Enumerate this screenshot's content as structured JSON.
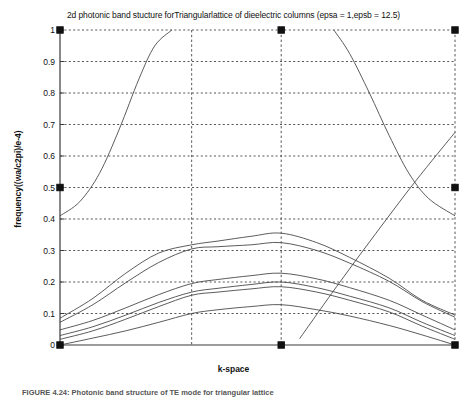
{
  "figure": {
    "title": "2d photonic band stucture forTriangularlattice of dieelectric columns (epsa = 1,epsb = 12.5)",
    "caption": "FIGURE 4.24: Photonic band structure of TE mode for triangular lattice",
    "background": "#ffffff",
    "line_color": "#4a4a4a",
    "axis_color": "#3a3a3a",
    "grid_color": "#555555"
  },
  "chart_data": {
    "type": "line",
    "title": "2d photonic band stucture forTriangularlattice of dieelectric columns (epsa = 1,epsb = 12.5)",
    "xlabel": "k-space",
    "ylabel": "frequency((wa/c2pi)/e-4)",
    "grid": true,
    "legend": "none",
    "xlim": [
      0,
      3
    ],
    "ylim": [
      0,
      1
    ],
    "yticks": [
      0,
      0.1,
      0.2,
      0.3,
      0.4,
      0.5,
      0.6,
      0.7,
      0.8,
      0.9,
      1
    ],
    "ytick_labels": [
      "0",
      "0.1",
      "0.2",
      "0.3",
      "0.4",
      "0.5",
      "0.6",
      "0.7",
      "0.8",
      "0.9",
      "1"
    ],
    "xticks": [
      0,
      1,
      1.68,
      3
    ],
    "xtick_labels": [
      "t",
      "m",
      "k",
      "t"
    ],
    "x_symmetry_points": [
      "t",
      "m",
      "k",
      "t"
    ],
    "marker_points": [
      {
        "x": 0,
        "y": 1
      },
      {
        "x": 1.68,
        "y": 1
      },
      {
        "x": 3,
        "y": 1
      },
      {
        "x": 0,
        "y": 0.5
      },
      {
        "x": 3,
        "y": 0.5
      },
      {
        "x": 0,
        "y": 0
      },
      {
        "x": 1.68,
        "y": 0
      },
      {
        "x": 3,
        "y": 0
      }
    ],
    "series": [
      {
        "name": "band-1",
        "x": [
          0,
          0.25,
          0.5,
          0.75,
          1.0,
          1.2,
          1.45,
          1.68,
          1.95,
          2.2,
          2.5,
          2.75,
          3.0
        ],
        "values": [
          0.0,
          0.022,
          0.045,
          0.072,
          0.1,
          0.112,
          0.122,
          0.128,
          0.112,
          0.092,
          0.062,
          0.032,
          0.0
        ]
      },
      {
        "name": "band-2",
        "x": [
          0,
          0.25,
          0.5,
          0.75,
          1.0,
          1.2,
          1.45,
          1.68,
          1.95,
          2.2,
          2.5,
          2.75,
          3.0
        ],
        "values": [
          0.018,
          0.045,
          0.082,
          0.122,
          0.158,
          0.168,
          0.178,
          0.185,
          0.168,
          0.142,
          0.105,
          0.06,
          0.018
        ]
      },
      {
        "name": "band-3",
        "x": [
          0,
          0.25,
          0.5,
          0.75,
          1.0,
          1.2,
          1.45,
          1.68,
          1.95,
          2.2,
          2.5,
          2.75,
          3.0
        ],
        "values": [
          0.03,
          0.058,
          0.095,
          0.135,
          0.168,
          0.18,
          0.192,
          0.2,
          0.182,
          0.155,
          0.118,
          0.072,
          0.03
        ]
      },
      {
        "name": "band-4",
        "x": [
          0,
          0.25,
          0.5,
          0.75,
          1.0,
          1.2,
          1.45,
          1.68,
          1.95,
          2.2,
          2.5,
          2.75,
          3.0
        ],
        "values": [
          0.048,
          0.078,
          0.118,
          0.16,
          0.195,
          0.208,
          0.22,
          0.228,
          0.21,
          0.182,
          0.142,
          0.095,
          0.048
        ]
      },
      {
        "name": "band-5",
        "x": [
          0,
          0.25,
          0.5,
          0.75,
          1.0,
          1.2,
          1.45,
          1.68,
          1.95,
          2.2,
          2.5,
          2.75,
          3.0
        ],
        "values": [
          0.072,
          0.128,
          0.198,
          0.262,
          0.305,
          0.312,
          0.318,
          0.325,
          0.3,
          0.26,
          0.202,
          0.138,
          0.088
        ]
      },
      {
        "name": "band-6",
        "x": [
          0,
          0.25,
          0.5,
          0.75,
          1.0,
          1.2,
          1.45,
          1.68,
          1.95,
          2.2,
          2.5,
          2.75,
          3.0
        ],
        "values": [
          0.085,
          0.148,
          0.228,
          0.292,
          0.318,
          0.33,
          0.345,
          0.355,
          0.325,
          0.278,
          0.212,
          0.142,
          0.095
        ]
      },
      {
        "name": "band-7-steep",
        "x": [
          0,
          0.15,
          0.3,
          0.45,
          0.6,
          0.72,
          0.85
        ],
        "values": [
          0.41,
          0.455,
          0.545,
          0.685,
          0.845,
          0.95,
          1.0
        ]
      },
      {
        "name": "band-8-descending",
        "x": [
          2.08,
          2.2,
          2.35,
          2.5,
          2.65,
          2.8,
          3.0
        ],
        "values": [
          1.0,
          0.925,
          0.8,
          0.665,
          0.545,
          0.465,
          0.41
        ]
      },
      {
        "name": "band-9-diagonal",
        "x": [
          1.82,
          2.1,
          2.4,
          2.7,
          3.0
        ],
        "values": [
          0.02,
          0.185,
          0.355,
          0.52,
          0.675
        ]
      }
    ]
  }
}
